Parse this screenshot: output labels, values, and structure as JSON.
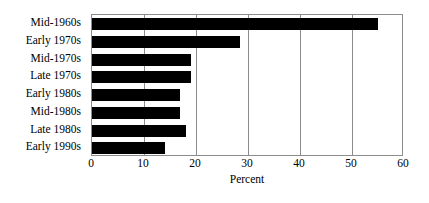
{
  "chart_data": {
    "type": "bar",
    "orientation": "horizontal",
    "title": "",
    "subtitle": "",
    "xlabel": "Percent",
    "ylabel": "",
    "xlim": [
      0,
      60
    ],
    "xticks": [
      0,
      10,
      20,
      30,
      40,
      50,
      60
    ],
    "xtick_labels": [
      "0",
      "10",
      "20",
      "30",
      "40",
      "50",
      "60"
    ],
    "grid": "vertical",
    "legend": null,
    "bar_color": "#000000",
    "grid_color": "#8c8c8c",
    "background_color": "#ffffff",
    "categories": [
      "Mid-1960s",
      "Early 1970s",
      "Mid-1970s",
      "Late 1970s",
      "Early 1980s",
      "Mid-1980s",
      "Late 1980s",
      "Early 1990s"
    ],
    "values": [
      55,
      28.5,
      19,
      19,
      17,
      17,
      18,
      14
    ]
  }
}
